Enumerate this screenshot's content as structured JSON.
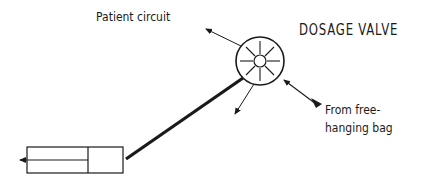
{
  "diagram": {
    "title": "DOSAGE VALVE",
    "labels": {
      "patient_circuit": "Patient circuit",
      "from_bag_line1": "From free-",
      "from_bag_line2": "hanging bag"
    },
    "components": [
      "dosage valve",
      "syringe",
      "connecting tube",
      "patient circuit outlet",
      "free-hanging bag inlet",
      "exhaust outlet"
    ],
    "colors": {
      "stroke": "#1a1a1a",
      "background": "#ffffff"
    }
  }
}
